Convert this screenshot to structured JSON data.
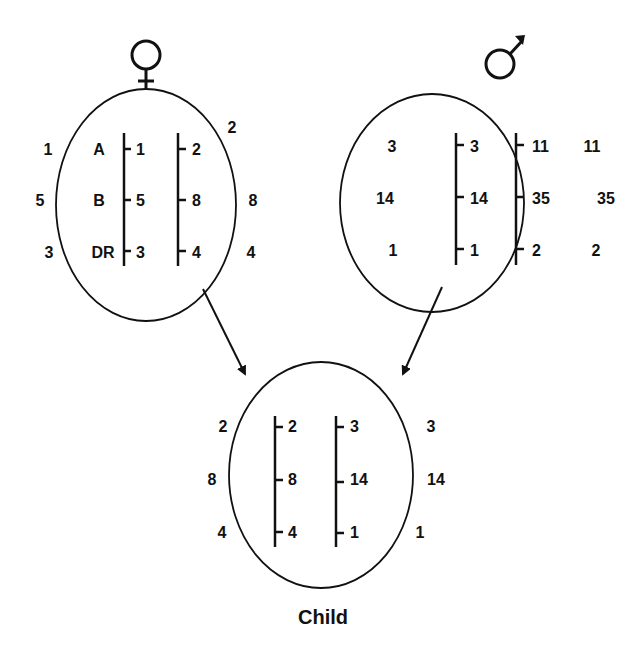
{
  "mother": {
    "symbol": "♀",
    "outer_left": [
      "1",
      "5",
      "3"
    ],
    "outer_right": [
      "2",
      "8",
      "4"
    ],
    "locus_labels": [
      "A",
      "B",
      "DR"
    ],
    "chromosome1": [
      "1",
      "5",
      "3"
    ],
    "chromosome2": [
      "2",
      "8",
      "4"
    ]
  },
  "father": {
    "symbol": "♂",
    "outer_left": [
      "3",
      "14",
      "1"
    ],
    "outer_right": [
      "11",
      "35",
      "2"
    ],
    "chromosome1": [
      "3",
      "14",
      "1"
    ],
    "chromosome2": [
      "11",
      "35",
      "2"
    ]
  },
  "child": {
    "label": "Child",
    "outer_left": [
      "2",
      "8",
      "4"
    ],
    "outer_right": [
      "3",
      "14",
      "1"
    ],
    "chromosome1": [
      "2",
      "8",
      "4"
    ],
    "chromosome2": [
      "3",
      "14",
      "1"
    ]
  }
}
